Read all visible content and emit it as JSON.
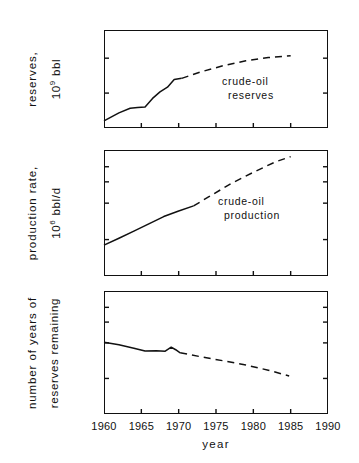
{
  "figure": {
    "background": "#ffffff",
    "ink": "#111111",
    "xaxis_title": "year",
    "x_ticks": [
      "1960",
      "1965",
      "1970",
      "1975",
      "1980",
      "1985",
      "1990"
    ],
    "x_range": [
      1960,
      1990
    ]
  },
  "panels": [
    {
      "id": "reserves",
      "axis_title_line1": "reserves,",
      "axis_title_line2_base": "10",
      "axis_title_line2_exp": "9",
      "axis_title_line2_tail": " bbl",
      "y_ticks": [
        "600",
        "400",
        "200",
        "100"
      ],
      "annotation_line1": "crude-oil",
      "annotation_line2": "reserves"
    },
    {
      "id": "production-rate",
      "axis_title_line1": "production rate,",
      "axis_title_line2_base": "10",
      "axis_title_line2_exp": "6",
      "axis_title_line2_tail": " bbl/d",
      "y_ticks": [
        "100",
        "80",
        "60",
        "40",
        "20",
        "10"
      ],
      "annotation_line1": "crude-oil",
      "annotation_line2": "production"
    },
    {
      "id": "years-remaining",
      "axis_title_line1": "number of years of",
      "axis_title_line2_base": "reserves remaining",
      "axis_title_line2_exp": "",
      "axis_title_line2_tail": "",
      "y_ticks": [
        "100",
        "80",
        "60",
        "40",
        "20",
        "10"
      ],
      "annotation_line1": "",
      "annotation_line2": ""
    }
  ],
  "chart_data": [
    {
      "type": "line",
      "title": "crude-oil reserves",
      "xlabel": "year",
      "ylabel": "reserves, 10^9 bbl",
      "yscale": "log",
      "ylim": [
        100,
        700
      ],
      "ytick_values": [
        600,
        400,
        200,
        100
      ],
      "xlim": [
        1960,
        1990
      ],
      "xtick_values": [
        1960,
        1965,
        1970,
        1975,
        1980,
        1985,
        1990
      ],
      "grid": false,
      "legend": "inside-annotation",
      "series": [
        {
          "name": "crude-oil reserves (historical)",
          "style": "solid",
          "x": [
            1960,
            1962,
            1963.5,
            1964.5,
            1965.5,
            1966.5,
            1967.5,
            1968.5,
            1969.4,
            1970.4
          ],
          "y": [
            115,
            135,
            148,
            150,
            152,
            180,
            205,
            225,
            262,
            268
          ]
        },
        {
          "name": "crude-oil reserves (projected)",
          "style": "dashed",
          "x": [
            1970.4,
            1973,
            1976,
            1979,
            1982,
            1985
          ],
          "y": [
            268,
            305,
            345,
            380,
            405,
            420
          ]
        }
      ]
    },
    {
      "type": "line",
      "title": "crude-oil production",
      "xlabel": "year",
      "ylabel": "production rate, 10^6 bbl/d",
      "yscale": "log",
      "ylim": [
        10,
        110
      ],
      "ytick_values": [
        100,
        80,
        60,
        40,
        20,
        10
      ],
      "xlim": [
        1960,
        1990
      ],
      "xtick_values": [
        1960,
        1965,
        1970,
        1975,
        1980,
        1985,
        1990
      ],
      "grid": false,
      "legend": "inside-annotation",
      "series": [
        {
          "name": "crude-oil production (historical)",
          "style": "solid",
          "x": [
            1960,
            1962,
            1964,
            1966,
            1968,
            1970,
            1972
          ],
          "y": [
            18,
            20.5,
            23.5,
            27,
            31,
            34.5,
            38
          ]
        },
        {
          "name": "crude-oil production (projected)",
          "style": "dashed",
          "x": [
            1972,
            1974,
            1977,
            1980,
            1983,
            1985
          ],
          "y": [
            38,
            45,
            58,
            72,
            88,
            97
          ]
        }
      ]
    },
    {
      "type": "line",
      "title": "number of years of reserves remaining",
      "xlabel": "year",
      "ylabel": "number of years of reserves remaining",
      "yscale": "log",
      "ylim": [
        10,
        110
      ],
      "ytick_values": [
        100,
        80,
        60,
        40,
        20,
        10
      ],
      "xlim": [
        1960,
        1990
      ],
      "xtick_values": [
        1960,
        1965,
        1970,
        1975,
        1980,
        1985,
        1990
      ],
      "grid": false,
      "legend": "none",
      "series": [
        {
          "name": "years remaining (historical)",
          "style": "solid",
          "x": [
            1960,
            1962,
            1964,
            1965.5,
            1967,
            1968.2,
            1969.0,
            1969.6,
            1970.2
          ],
          "y": [
            40.5,
            38.5,
            36,
            34.2,
            34.3,
            34.0,
            36.8,
            35.0,
            33.0
          ]
        },
        {
          "name": "years remaining (projected)",
          "style": "dashed",
          "x": [
            1970.2,
            1973,
            1976,
            1979,
            1982,
            1984.8
          ],
          "y": [
            33.0,
            30.5,
            28.2,
            26.0,
            23.5,
            21.0
          ]
        }
      ]
    }
  ]
}
